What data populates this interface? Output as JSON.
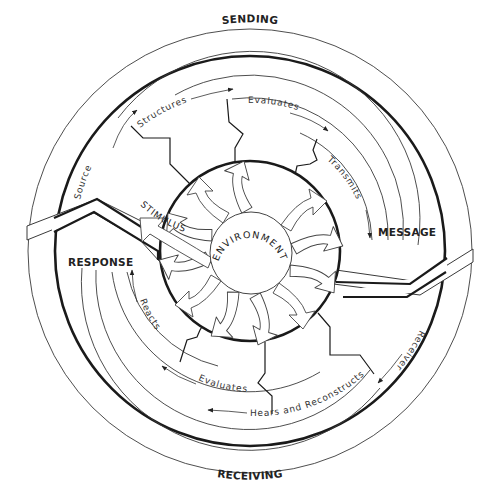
{
  "diagram": {
    "type": "communication-process-cycle",
    "hemispheres": {
      "top": "SENDING",
      "bottom": "RECEIVING"
    },
    "stage_labels": {
      "message": "MESSAGE",
      "response": "RESPONSE"
    },
    "center": {
      "label": "ENVIRONMENT",
      "input_label": "STIMULUS"
    },
    "sending_steps": [
      {
        "label": "Source"
      },
      {
        "label": "Structures"
      },
      {
        "label": "Evaluates"
      },
      {
        "label": "Transmits"
      }
    ],
    "receiving_steps": [
      {
        "label": "Receiver"
      },
      {
        "label": "Hears and Reconstructs"
      },
      {
        "label": "Evaluates"
      },
      {
        "label": "Reacts"
      }
    ],
    "colors": {
      "stroke": "#1a1a1a",
      "thin_stroke": "#3a3a3a",
      "background": "#ffffff"
    }
  }
}
